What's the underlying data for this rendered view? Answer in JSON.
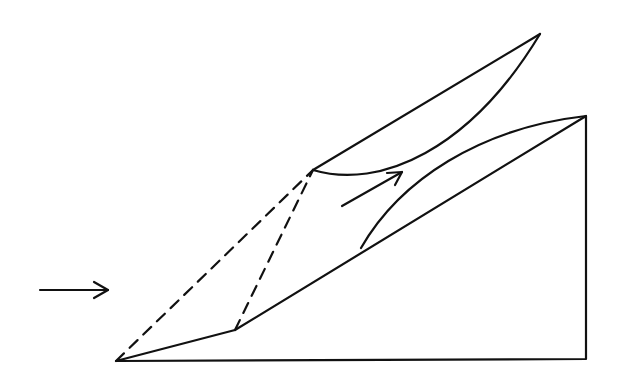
{
  "diagram": {
    "type": "supersonic-inlet-ramp-schematic",
    "stroke_color": "#111111",
    "background": "#ffffff",
    "elements": {
      "ramp_body": {
        "leading_edge": [
          116,
          361
        ],
        "kink": [
          235,
          330
        ],
        "top_corner": [
          586,
          116
        ],
        "bottom_right": [
          586,
          359
        ]
      },
      "inner_ramp_surface_start": [
        361,
        248
      ],
      "cowl": {
        "lip": [
          313,
          170
        ],
        "tip": [
          540,
          34
        ]
      },
      "oblique_shock_1": {
        "from": [
          116,
          361
        ],
        "to": [
          313,
          170
        ],
        "style": "dashed"
      },
      "oblique_shock_2": {
        "from": [
          235,
          330
        ],
        "to": [
          313,
          170
        ],
        "style": "dashed"
      },
      "freestream_arrow": {
        "from": [
          40,
          290
        ],
        "to": [
          108,
          290
        ]
      },
      "internal_flow_arrow": {
        "from": [
          342,
          206
        ],
        "to": [
          402,
          172
        ]
      }
    }
  }
}
